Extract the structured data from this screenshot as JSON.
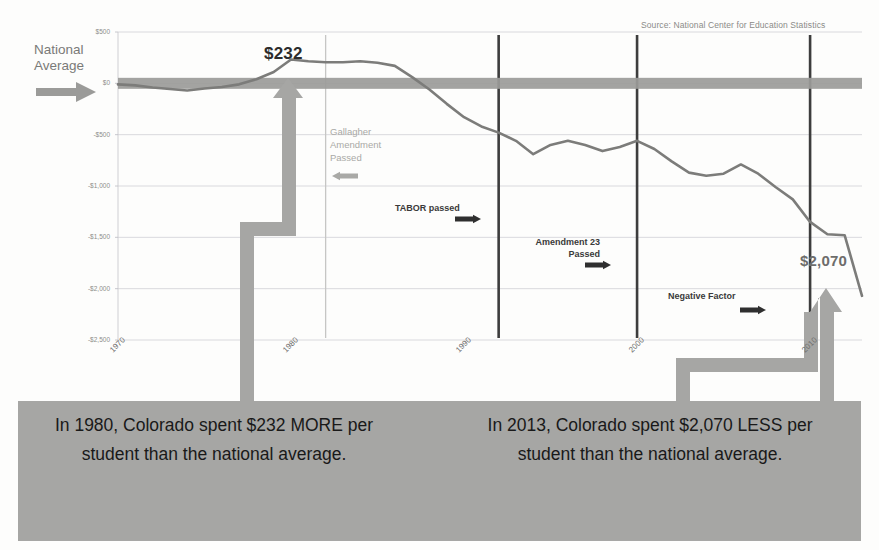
{
  "meta": {
    "source_note": "Source: National Center for Education Statistics",
    "national_average_label": "National\nAverage"
  },
  "callouts": {
    "peak_value": "$232",
    "trough_value": "$2,070"
  },
  "events": [
    {
      "id": "gallagher",
      "label": "Gallagher\nAmendment\nPassed",
      "year": 1982,
      "arrow": "left",
      "style": "faint"
    },
    {
      "id": "tabor",
      "label": "TABOR passed",
      "year": 1992,
      "arrow": "right",
      "style": "bold"
    },
    {
      "id": "amend23",
      "label": "Amendment 23\nPassed",
      "year": 2000,
      "arrow": "right",
      "style": "bold"
    },
    {
      "id": "negfactor",
      "label": "Negative Factor",
      "year": 2010,
      "arrow": "right",
      "style": "bold"
    }
  ],
  "captions": {
    "left": "In 1980,\nColorado spent\n$232 MORE per student\nthan the national average.",
    "right": "In 2013,\nColorado spent $2,070\nLESS per student than the\nnational average."
  },
  "chart_data": {
    "type": "line",
    "title": "",
    "subtitle": "",
    "xlabel": "",
    "ylabel": "",
    "xlim": [
      1970,
      2013
    ],
    "ylim": [
      -2500,
      500
    ],
    "grid": true,
    "legend": "none",
    "ytick_labels": [
      "$500",
      "$0",
      "-$500",
      "-$1,000",
      "-$1,500",
      "-$2,000",
      "-$2,500"
    ],
    "ytick_values": [
      500,
      0,
      -500,
      -1000,
      -1500,
      -2000,
      -2500
    ],
    "xtick_labels": [
      "1970",
      "1980",
      "1990",
      "2000",
      "2010"
    ],
    "xtick_values": [
      1970,
      1980,
      1990,
      2000,
      2010
    ],
    "reference_line": {
      "value": 0,
      "label": "National Average",
      "color": "#9b9b99",
      "width_px": 11
    },
    "series": [
      {
        "name": "Colorado per-pupil spending relative to national average",
        "color": "#7c7c7a",
        "x": [
          1970,
          1971,
          1972,
          1973,
          1974,
          1975,
          1976,
          1977,
          1978,
          1979,
          1980,
          1981,
          1982,
          1983,
          1984,
          1985,
          1986,
          1987,
          1988,
          1989,
          1990,
          1991,
          1992,
          1993,
          1994,
          1995,
          1996,
          1997,
          1998,
          1999,
          2000,
          2001,
          2002,
          2003,
          2004,
          2005,
          2006,
          2007,
          2008,
          2009,
          2010,
          2011,
          2012,
          2013
        ],
        "y": [
          -10,
          -20,
          -40,
          -55,
          -70,
          -50,
          -35,
          -10,
          40,
          110,
          232,
          215,
          205,
          205,
          215,
          200,
          170,
          60,
          -60,
          -200,
          -330,
          -420,
          -480,
          -560,
          -690,
          -600,
          -560,
          -600,
          -660,
          -620,
          -560,
          -640,
          -760,
          -870,
          -900,
          -880,
          -790,
          -880,
          -1010,
          -1130,
          -1350,
          -1470,
          -1480,
          -2070
        ]
      }
    ],
    "annotations": [
      {
        "text": "$232",
        "x": 1980,
        "y": 232,
        "placement": "above"
      },
      {
        "text": "$2,070",
        "x": 2013,
        "y": -2070,
        "placement": "right"
      }
    ]
  }
}
